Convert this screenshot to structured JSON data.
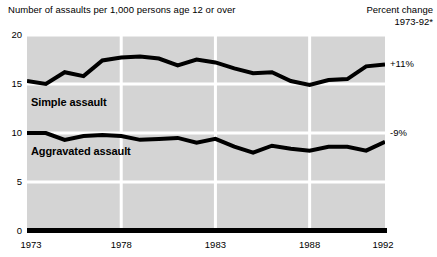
{
  "header": {
    "title": "Number of assaults per 1,000 persons age 12 or over",
    "right_line1": "Percent change",
    "right_line2": "1973-92*"
  },
  "annotations": {
    "simple_pct": "+11%",
    "aggravated_pct": "-9%",
    "simple_label": "Simple assault",
    "aggravated_label": "Aggravated assault"
  },
  "axis": {
    "y_ticks": [
      "0",
      "5",
      "10",
      "15",
      "20"
    ],
    "x_ticks": [
      "1973",
      "1978",
      "1983",
      "1988",
      "1992"
    ]
  },
  "colors": {
    "plot_background": "#d4d4d4",
    "gridline": "#ffffff",
    "line": "#000000",
    "text": "#000000"
  },
  "chart_data": {
    "type": "line",
    "title": "Number of assaults per 1,000 persons age 12 or over",
    "subtitle": "Percent change 1973-92*",
    "xlabel": "",
    "ylabel": "Number of assaults per 1,000 persons age 12 or over",
    "xlim": [
      1973,
      1992
    ],
    "ylim": [
      0,
      20
    ],
    "y_ticks": [
      0,
      5,
      10,
      15,
      20
    ],
    "x_ticks": [
      1973,
      1978,
      1983,
      1988,
      1992
    ],
    "grid": true,
    "legend": "inline-labels",
    "x": [
      1973,
      1974,
      1975,
      1976,
      1977,
      1978,
      1979,
      1980,
      1981,
      1982,
      1983,
      1984,
      1985,
      1986,
      1987,
      1988,
      1989,
      1990,
      1991,
      1992
    ],
    "series": [
      {
        "name": "Simple assault",
        "percent_change": "+11%",
        "values": [
          15.3,
          15.0,
          16.2,
          15.8,
          17.4,
          17.7,
          17.8,
          17.6,
          16.9,
          17.5,
          17.2,
          16.6,
          16.1,
          16.2,
          15.3,
          14.9,
          15.4,
          15.5,
          16.8,
          17.0
        ]
      },
      {
        "name": "Aggravated assault",
        "percent_change": "-9%",
        "values": [
          10.0,
          10.0,
          9.3,
          9.7,
          9.8,
          9.7,
          9.3,
          9.4,
          9.5,
          9.0,
          9.4,
          8.6,
          8.0,
          8.7,
          8.4,
          8.2,
          8.6,
          8.6,
          8.2,
          9.1
        ]
      }
    ]
  }
}
